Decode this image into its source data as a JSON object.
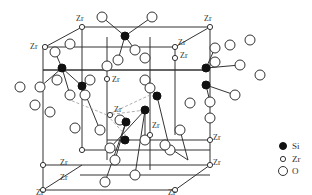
{
  "diagram": {
    "type": "crystal-structure",
    "atom_labels": {
      "zr": "Zr"
    },
    "legend": [
      {
        "key": "si",
        "label": "Si",
        "marker": "filled-small-circle"
      },
      {
        "key": "zr",
        "label": "Zr",
        "marker": "open-small-circle"
      },
      {
        "key": "o",
        "label": "O",
        "marker": "open-large-circle"
      }
    ],
    "colors": {
      "line": "#333333",
      "si_fill": "#111111",
      "open_fill": "#ffffff",
      "dashed": "#999999"
    }
  }
}
